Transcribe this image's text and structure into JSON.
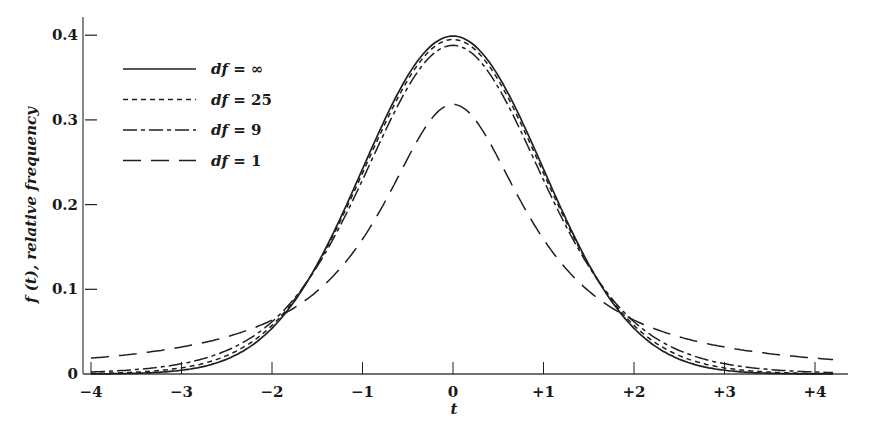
{
  "chart_data": {
    "type": "line",
    "title": "",
    "xlabel": "t",
    "ylabel": "f (t), relative frequency",
    "xlim": [
      -4,
      4
    ],
    "ylim": [
      0,
      0.4
    ],
    "grid": false,
    "legend_position": "upper-left",
    "x_ticks": [
      -4,
      -3,
      -2,
      -1,
      0,
      1,
      2,
      3,
      4
    ],
    "x_tick_labels": [
      "−4",
      "−3",
      "−2",
      "−1",
      "0",
      "+1",
      "+2",
      "+3",
      "+4"
    ],
    "y_ticks": [
      0,
      0.1,
      0.2,
      0.3,
      0.4
    ],
    "y_tick_labels": [
      "0",
      "0.1",
      "0.2",
      "0.3",
      "0.4"
    ],
    "x": [
      -4,
      -3.5,
      -3,
      -2.5,
      -2,
      -1.75,
      -1.5,
      -1,
      -0.5,
      0,
      0.5,
      1,
      1.5,
      1.75,
      2,
      2.5,
      3,
      3.5,
      4
    ],
    "series": [
      {
        "name": "df = ∞",
        "df": "inf",
        "style": "solid",
        "peak": 0.399,
        "values": [
          0.0001,
          0.0009,
          0.0044,
          0.0175,
          0.054,
          0.0863,
          0.1295,
          0.242,
          0.3521,
          0.3989,
          0.3521,
          0.242,
          0.1295,
          0.0863,
          0.054,
          0.0175,
          0.0044,
          0.0009,
          0.0001
        ]
      },
      {
        "name": "df = 25",
        "df": 25,
        "style": "short-dash",
        "peak": 0.396,
        "values": [
          0.0006,
          0.0021,
          0.0069,
          0.0209,
          0.0557,
          0.0859,
          0.1268,
          0.2365,
          0.3474,
          0.3958,
          0.3474,
          0.2365,
          0.1268,
          0.0859,
          0.0557,
          0.0209,
          0.0069,
          0.0021,
          0.0006
        ]
      },
      {
        "name": "df = 9",
        "df": 9,
        "style": "dash-dot",
        "peak": 0.388,
        "values": [
          0.0035,
          0.0064,
          0.0129,
          0.0273,
          0.0584,
          0.0842,
          0.1192,
          0.2304,
          0.3391,
          0.388,
          0.3391,
          0.2304,
          0.1192,
          0.0842,
          0.0584,
          0.0273,
          0.0129,
          0.0064,
          0.0035
        ]
      },
      {
        "name": "df = 1",
        "df": 1,
        "style": "long-dash",
        "peak": 0.318,
        "values": [
          0.0187,
          0.0241,
          0.0318,
          0.0439,
          0.0637,
          0.0788,
          0.0979,
          0.1592,
          0.2546,
          0.3183,
          0.2546,
          0.1592,
          0.0979,
          0.0788,
          0.0637,
          0.0439,
          0.0318,
          0.0241,
          0.0187
        ]
      }
    ],
    "annotations": [
      "All curves cross near t = ±1.75, f ≈ 0.08"
    ]
  },
  "legend": {
    "items": [
      {
        "label": "df = ∞",
        "style": "solid"
      },
      {
        "label": "df = 25",
        "style": "short-dash"
      },
      {
        "label": "df = 9",
        "style": "dash-dot"
      },
      {
        "label": "df = 1",
        "style": "long-dash"
      }
    ]
  }
}
